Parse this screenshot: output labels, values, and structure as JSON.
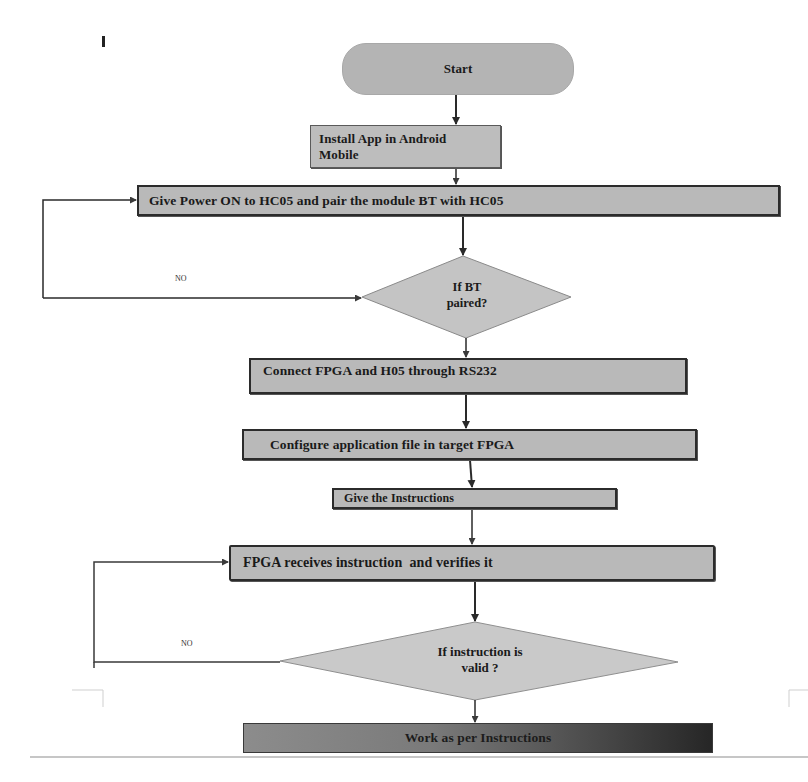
{
  "diagram": {
    "type": "flowchart",
    "stray_mark": "I",
    "nodes": {
      "start": {
        "label": "Start",
        "shape": "terminator"
      },
      "install_app": {
        "label_line1": "Install App in Android",
        "label_line2": "Mobile",
        "shape": "process"
      },
      "power_pair": {
        "label": "Give Power ON to HC05 and pair the module BT with HC05",
        "shape": "process"
      },
      "bt_paired": {
        "label_line1": "If BT",
        "label_line2": "paired?",
        "shape": "decision"
      },
      "connect_fpga": {
        "label": "Connect FPGA and H05 through RS232",
        "shape": "process"
      },
      "configure": {
        "label": "Configure application file in target FPGA",
        "shape": "process"
      },
      "give_instructions": {
        "label": "Give the Instructions",
        "shape": "process"
      },
      "fpga_receives": {
        "label": "FPGA receives instruction  and verifies it",
        "shape": "process"
      },
      "instruction_valid": {
        "label_line1": "If instruction is",
        "label_line2": "valid ?",
        "shape": "decision"
      },
      "work": {
        "label": "Work as per Instructions",
        "shape": "process"
      }
    },
    "edge_labels": {
      "bt_no": "NO",
      "instruction_no": "NO"
    },
    "edges": [
      {
        "from": "start",
        "to": "install_app"
      },
      {
        "from": "install_app",
        "to": "power_pair"
      },
      {
        "from": "power_pair",
        "to": "bt_paired"
      },
      {
        "from": "bt_paired",
        "to": "power_pair",
        "label": "NO"
      },
      {
        "from": "bt_paired",
        "to": "connect_fpga"
      },
      {
        "from": "connect_fpga",
        "to": "configure"
      },
      {
        "from": "configure",
        "to": "give_instructions"
      },
      {
        "from": "give_instructions",
        "to": "fpga_receives"
      },
      {
        "from": "fpga_receives",
        "to": "instruction_valid"
      },
      {
        "from": "instruction_valid",
        "to": "fpga_receives",
        "label": "NO"
      },
      {
        "from": "instruction_valid",
        "to": "work"
      }
    ],
    "colors": {
      "box_fill": "#b9b9b9",
      "box_border": "#2b2b2b",
      "diamond_fill": "#c4c4c4",
      "diamond_border": "#8a8a8a",
      "line": "#2a2a2a",
      "final_gradient_start": "#8c8c8c",
      "final_gradient_end": "#262626"
    }
  }
}
